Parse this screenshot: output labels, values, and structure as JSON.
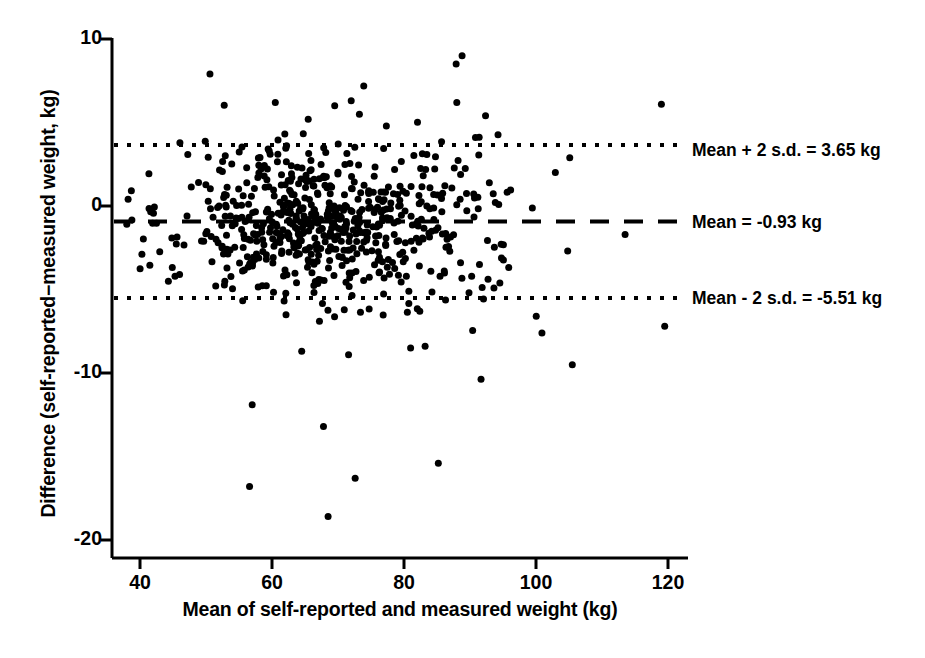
{
  "chart_data": {
    "type": "scatter",
    "title": "",
    "xlabel": "Mean of self-reported and measured weight (kg)",
    "ylabel": "Difference (self-reported−measured weight, kg)",
    "xlim": [
      36,
      124
    ],
    "ylim": [
      -21.5,
      11.5
    ],
    "xticks": [
      40,
      60,
      80,
      100,
      120
    ],
    "xtick_labels": [
      "40",
      "60",
      "80",
      "100",
      "120"
    ],
    "yticks": [
      10,
      0,
      -10,
      -20
    ],
    "ytick_labels": [
      "10",
      "0",
      "-10",
      "-20"
    ],
    "grid": false,
    "legend": "none",
    "marker_color": "#000000",
    "marker_size": 7,
    "reference_lines": [
      {
        "name": "upper-limit",
        "value": 3.65,
        "style": "dotted",
        "label": "Mean + 2 s.d. = 3.65 kg"
      },
      {
        "name": "mean",
        "value": -0.93,
        "style": "dashed",
        "label": "Mean = -0.93 kg"
      },
      {
        "name": "lower-limit",
        "value": -5.51,
        "style": "dotted",
        "label": "Mean - 2 s.d. = -5.51 kg"
      }
    ],
    "statistics": {
      "mean_difference": -0.93,
      "sd": 2.29,
      "upper_limit_of_agreement": 3.65,
      "lower_limit_of_agreement": -5.51,
      "n_points": 640,
      "units": "kg"
    },
    "outliers": [
      {
        "x": 57.0,
        "y": -11.9
      },
      {
        "x": 56.6,
        "y": -16.8
      },
      {
        "x": 68.5,
        "y": -18.6
      },
      {
        "x": 67.8,
        "y": -13.2
      },
      {
        "x": 72.6,
        "y": -16.3
      },
      {
        "x": 85.2,
        "y": -15.4
      },
      {
        "x": 88.8,
        "y": 9.0
      },
      {
        "x": 87.9,
        "y": 8.5
      },
      {
        "x": 50.6,
        "y": 7.9
      },
      {
        "x": 60.5,
        "y": 6.2
      },
      {
        "x": 69.5,
        "y": 6.0
      },
      {
        "x": 72.0,
        "y": 6.3
      },
      {
        "x": 88.0,
        "y": 6.2
      },
      {
        "x": 119.0,
        "y": 6.1
      },
      {
        "x": 105.5,
        "y": -9.5
      },
      {
        "x": 119.5,
        "y": -7.2
      },
      {
        "x": 100.9,
        "y": -7.6
      },
      {
        "x": 104.8,
        "y": -2.7
      },
      {
        "x": 113.5,
        "y": -1.7
      },
      {
        "x": 38.2,
        "y": 0.4
      },
      {
        "x": 38.0,
        "y": -1.1
      },
      {
        "x": 44.3,
        "y": -4.5
      },
      {
        "x": 64.5,
        "y": -8.7
      },
      {
        "x": 71.6,
        "y": -8.9
      },
      {
        "x": 81.0,
        "y": -8.5
      },
      {
        "x": 83.2,
        "y": -8.4
      }
    ]
  },
  "axes": {
    "x_title": "Mean of self-reported and measured weight (kg)",
    "y_title": "Difference (self-reported−measured weight, kg)"
  },
  "annotations": {
    "upper": "Mean + 2 s.d. = 3.65 kg",
    "mean": "Mean = -0.93 kg",
    "lower": "Mean - 2 s.d. = -5.51 kg"
  },
  "ticks": {
    "x": [
      "40",
      "60",
      "80",
      "100",
      "120"
    ],
    "y": [
      "10",
      "0",
      "-10",
      "-20"
    ]
  }
}
